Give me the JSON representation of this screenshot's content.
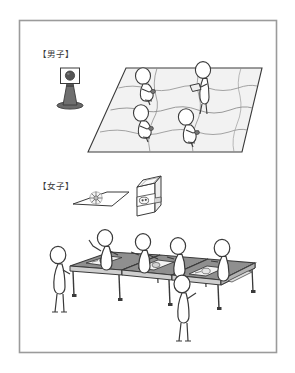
{
  "figure": {
    "frame": {
      "border_color": "#9b9b9b",
      "background": "#ffffff"
    },
    "sections": [
      {
        "id": "boys",
        "label": "【男子】",
        "label_x": 38,
        "label_y": 56,
        "items": [
          {
            "name": "batting-tee",
            "description": "tee stand with ball on square backboard"
          },
          {
            "name": "ground-mat",
            "description": "large perspective mat divided by wavy lines"
          },
          {
            "name": "participants",
            "count": 4,
            "description": "stick figures working on the mat"
          }
        ]
      },
      {
        "id": "girls",
        "label": "【女子】",
        "label_x": 38,
        "label_y": 186,
        "items": [
          {
            "name": "flower-mat",
            "description": "flat mat with radial flower shape"
          },
          {
            "name": "open-box",
            "description": "tall open box containing an object"
          },
          {
            "name": "table-row",
            "count": 4,
            "description": "row of four tables with trays"
          },
          {
            "name": "participants",
            "count": 6,
            "description": "stick figures standing around the tables"
          }
        ]
      }
    ],
    "colors": {
      "line": "#3a3a3a",
      "frame": "#9b9b9b",
      "mat_fill": "#f0f0f0",
      "table_top": "#8f8f8f",
      "table_side": "#d9d9d9",
      "tee_dark": "#5c5c5c",
      "ball_dark": "#555555",
      "figure_fill": "#ffffff"
    }
  }
}
